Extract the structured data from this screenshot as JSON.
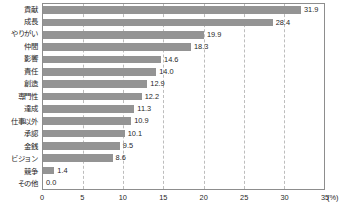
{
  "chart_data": {
    "type": "bar",
    "orientation": "horizontal",
    "title": "",
    "xlabel": "(%)",
    "ylabel": "",
    "xlim": [
      0,
      35
    ],
    "ylim": null,
    "grid": true,
    "legend": false,
    "xticks": [
      0,
      5,
      10,
      15,
      20,
      25,
      30,
      35
    ],
    "xtick_labels": [
      "0",
      "5",
      "10",
      "15",
      "20",
      "25",
      "30",
      "35"
    ],
    "unit_label": "(%)",
    "bar_color": "#949494",
    "categories": [
      "貢献",
      "成長",
      "やりがい",
      "仲間",
      "影響",
      "責任",
      "創造",
      "専門性",
      "達成",
      "仕事以外",
      "承認",
      "金銭",
      "ビジョン",
      "競争",
      "その他"
    ],
    "values": [
      31.9,
      28.4,
      19.9,
      18.3,
      14.6,
      14.0,
      12.9,
      12.2,
      11.3,
      10.9,
      10.1,
      9.5,
      8.6,
      1.4,
      0.0
    ],
    "value_labels": [
      "31.9",
      "28.4",
      "19.9",
      "18.3",
      "14.6",
      "14.0",
      "12.9",
      "12.2",
      "11.3",
      "10.9",
      "10.1",
      "9.5",
      "8.6",
      "1.4",
      "0.0"
    ]
  }
}
